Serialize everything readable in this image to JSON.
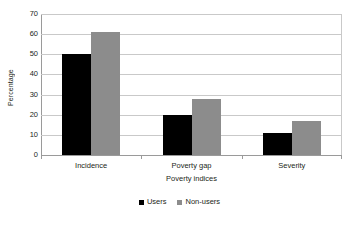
{
  "chart_data": {
    "type": "bar",
    "title": "",
    "xlabel": "Poverty indices",
    "ylabel": "Percentage",
    "categories": [
      "Incidence",
      "Poverty gap",
      "Severity"
    ],
    "series": [
      {
        "name": "Users",
        "color": "#000000",
        "values": [
          50,
          20,
          11
        ]
      },
      {
        "name": "Non-users",
        "color": "#8c8c8c",
        "values": [
          61,
          28,
          17
        ]
      }
    ],
    "ylim": [
      0,
      70
    ],
    "ytick_step": 10,
    "yticks": [
      0,
      10,
      20,
      30,
      40,
      50,
      60,
      70
    ],
    "ytick_labels": [
      "0",
      "10",
      "20",
      "30",
      "40",
      "50",
      "60",
      "70"
    ],
    "grid": {
      "horizontal": true,
      "vertical": false
    },
    "legend": {
      "position": "bottom",
      "entries": [
        "Users",
        "Non-users"
      ]
    },
    "axis_colors": {
      "gridline": "#c9c9c9",
      "axis": "#9a9a9a"
    }
  }
}
